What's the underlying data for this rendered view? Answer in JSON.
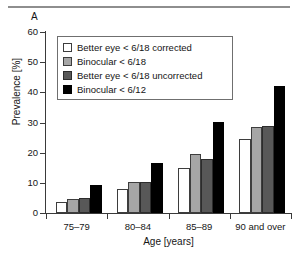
{
  "figure": {
    "panel_label": "A"
  },
  "chart_data": {
    "type": "bar",
    "title": "",
    "xlabel": "Age [years]",
    "ylabel": "Prevalence [%]",
    "categories": [
      "75–79",
      "80–84",
      "85–89",
      "90 and over"
    ],
    "ylim": [
      0,
      60
    ],
    "yticks": [
      0,
      10,
      20,
      30,
      40,
      50,
      60
    ],
    "ytick_labels": [
      "0",
      "10",
      "20",
      "30",
      "40",
      "50",
      "60"
    ],
    "grid": false,
    "legend_position": "upper left",
    "series": [
      {
        "name": "Better eye < 6/18 corrected",
        "color": "#ffffff",
        "values": [
          3.5,
          8.0,
          14.8,
          24.5
        ]
      },
      {
        "name": "Binocular < 6/18",
        "color": "#a6a6a6",
        "values": [
          4.7,
          10.2,
          19.5,
          28.5
        ]
      },
      {
        "name": "Better eye < 6/18 uncorrected",
        "color": "#585858",
        "values": [
          5.0,
          10.2,
          17.8,
          28.7
        ]
      },
      {
        "name": "Binocular < 6/12",
        "color": "#000000",
        "values": [
          9.3,
          16.5,
          30.2,
          42.0
        ]
      }
    ]
  }
}
